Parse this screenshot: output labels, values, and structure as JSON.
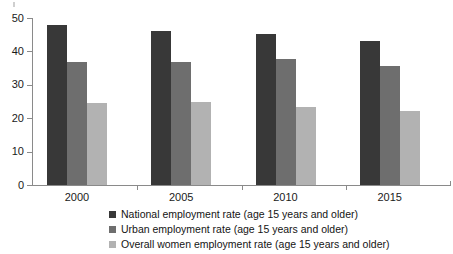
{
  "chart_data": {
    "type": "bar",
    "title": "",
    "subtitle": "",
    "xlabel": "",
    "ylabel": "",
    "ylim": [
      0,
      50
    ],
    "yticks": [
      0,
      10,
      20,
      30,
      40,
      50
    ],
    "grid": false,
    "legend_position": "bottom-left",
    "categories": [
      "2000",
      "2005",
      "2010",
      "2015"
    ],
    "series": [
      {
        "name": "National employment rate (age 15 years and older)",
        "color": "#383838",
        "values": [
          48.0,
          46.0,
          45.2,
          43.0
        ]
      },
      {
        "name": "Urban employment rate (age 15 years and older)",
        "color": "#6e6e6e",
        "values": [
          36.8,
          36.8,
          37.8,
          35.6
        ]
      },
      {
        "name": "Overall women employment rate (age 15 years and older)",
        "color": "#b2b2b2",
        "values": [
          24.5,
          25.0,
          23.5,
          22.3
        ]
      }
    ]
  },
  "axis": {
    "y_tick_labels": [
      "50",
      "40",
      "30",
      "20",
      "10",
      "0"
    ],
    "x_tick_labels": [
      "2000",
      "2005",
      "2010",
      "2015"
    ]
  },
  "legend": {
    "items": [
      {
        "label": "National employment rate (age 15 years and older)",
        "color": "#383838"
      },
      {
        "label": "Urban employment rate (age 15 years and older)",
        "color": "#6e6e6e"
      },
      {
        "label": "Overall women employment rate (age 15 years and older)",
        "color": "#b2b2b2"
      }
    ]
  },
  "colors": {
    "series_1": "#383838",
    "series_2": "#6e6e6e",
    "series_3": "#b2b2b2",
    "axis": "#8a8a8a",
    "text": "#1a1a1a",
    "background": "#ffffff"
  }
}
